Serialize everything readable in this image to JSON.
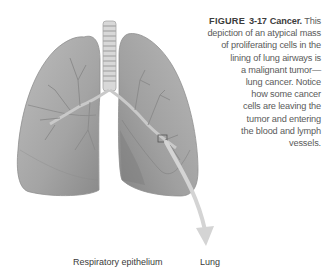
{
  "figure": {
    "label": "FIGURE",
    "number": "3-17",
    "title": "Cancer.",
    "caption_lines": [
      "This",
      "depiction of an atypical mass",
      "of proliferating cells in the",
      "lining of lung airways is",
      "a malignant tumor—",
      "lung cancer. Notice",
      "how some cancer",
      "cells are leaving the",
      "tumor and entering",
      "the blood and lymph",
      "vessels."
    ]
  },
  "labels": {
    "respiratory_epithelium": "Respiratory epithelium",
    "lung": "Lung"
  },
  "colors": {
    "lung_fill": "#a8a8a8",
    "lung_dark": "#7d7d7d",
    "arrow": "#d6d6d6",
    "caption_text": "#5a5a5a"
  }
}
